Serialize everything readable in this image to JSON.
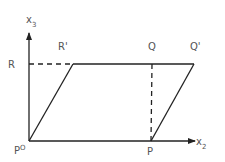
{
  "diagram": {
    "axes": {
      "vertical": {
        "label": "x",
        "subscript": "3"
      },
      "horizontal": {
        "label": "x",
        "subscript": "2"
      }
    },
    "points": {
      "origin": {
        "label": "P",
        "superscript": "O"
      },
      "P": {
        "label": "P"
      },
      "R": {
        "label": "R"
      },
      "R_prime": {
        "label": "R'"
      },
      "Q": {
        "label": "Q"
      },
      "Q_prime": {
        "label": "Q'"
      }
    },
    "shape": "parallelogram P°-P-Q'-R'",
    "dashed_lines": [
      "R to R'",
      "P to Q"
    ]
  }
}
